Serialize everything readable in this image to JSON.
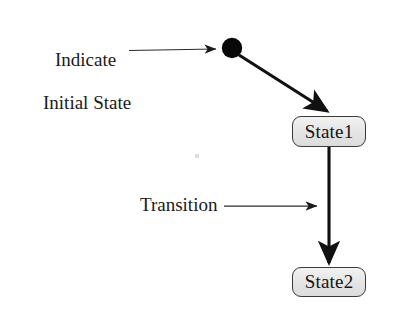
{
  "figure": {
    "type": "uml-state-diagram",
    "background_color": "#ffffff",
    "ink_color": "#1a1a1a"
  },
  "callouts": [
    {
      "id": "initial-state-callout",
      "text": "Indicate\nInitial State",
      "line1": "Indicate",
      "line2": "Initial State",
      "points_to": "initial-state-node"
    },
    {
      "id": "transition-callout",
      "text": "Transition",
      "points_to": "transition-state1-state2"
    }
  ],
  "nodes": [
    {
      "id": "initial-state-node",
      "kind": "initial-pseudostate",
      "shape": "filled-circle",
      "fill": "#000000",
      "cx": 232,
      "cy": 48,
      "r": 10
    },
    {
      "id": "state-node-1",
      "kind": "state",
      "label": "State1",
      "shape": "rounded-rectangle",
      "fill": "#e6e6e6",
      "border": "#3a3a3a"
    },
    {
      "id": "state-node-2",
      "kind": "state",
      "label": "State2",
      "shape": "rounded-rectangle",
      "fill": "#e6e6e6",
      "border": "#3a3a3a"
    }
  ],
  "edges": [
    {
      "id": "transition-initial-state1",
      "kind": "transition",
      "from": "initial-state-node",
      "to": "state-node-1",
      "style": "thick-solid-filled-arrowhead"
    },
    {
      "id": "transition-state1-state2",
      "kind": "transition",
      "from": "state-node-1",
      "to": "state-node-2",
      "style": "thick-solid-filled-arrowhead"
    },
    {
      "id": "callout-arrow-initial",
      "kind": "annotation-pointer",
      "from": "initial-state-callout",
      "to": "initial-state-node",
      "style": "thin-solid-filled-arrowhead"
    },
    {
      "id": "callout-arrow-transition",
      "kind": "annotation-pointer",
      "from": "transition-callout",
      "to": "transition-state1-state2",
      "style": "thin-solid-filled-arrowhead"
    }
  ]
}
